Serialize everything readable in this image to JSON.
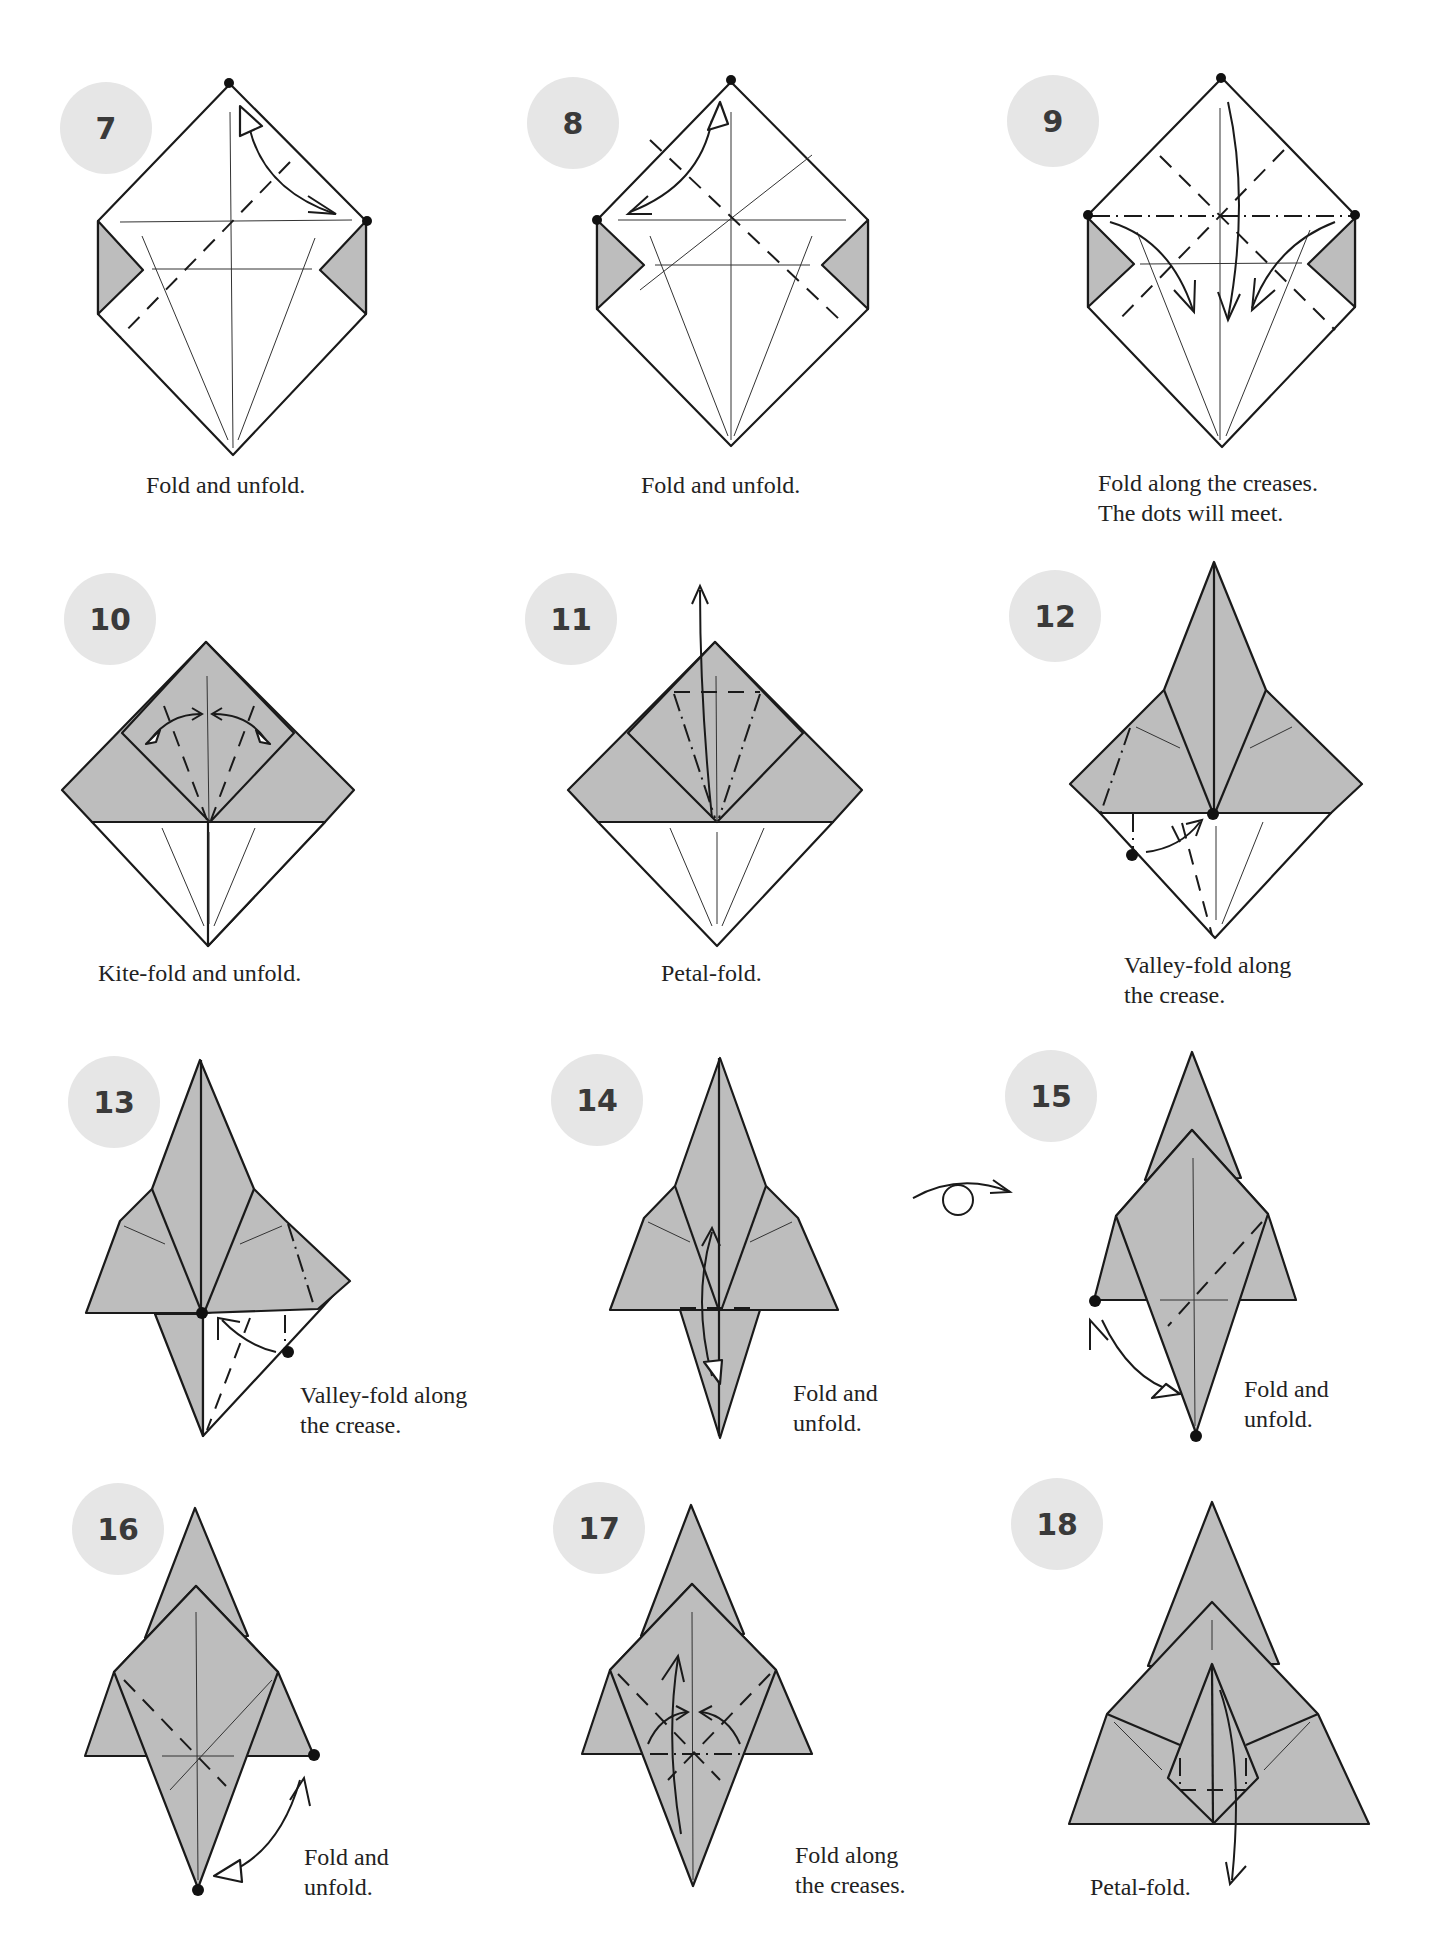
{
  "page": {
    "steps": [
      {
        "number": "7",
        "caption": "Fold and unfold."
      },
      {
        "number": "8",
        "caption": "Fold and unfold."
      },
      {
        "number": "9",
        "caption": "Fold along the creases.\nThe dots will meet."
      },
      {
        "number": "10",
        "caption": "Kite-fold and unfold."
      },
      {
        "number": "11",
        "caption": "Petal-fold."
      },
      {
        "number": "12",
        "caption": "Valley-fold along\nthe crease."
      },
      {
        "number": "13",
        "caption": "Valley-fold along\nthe crease."
      },
      {
        "number": "14",
        "caption": "Fold and\nunfold."
      },
      {
        "number": "15",
        "caption": "Fold and\nunfold."
      },
      {
        "number": "16",
        "caption": "Fold and\nunfold."
      },
      {
        "number": "17",
        "caption": "Fold along\nthe creases."
      },
      {
        "number": "18",
        "caption": "Petal-fold."
      }
    ],
    "symbols": {
      "turn_over": "turn-over-icon"
    },
    "colors": {
      "paper_colored": "#bdbdbd",
      "paper_white": "#ffffff",
      "badge": "#e6e6e6",
      "line": "#1a1a1a"
    }
  }
}
